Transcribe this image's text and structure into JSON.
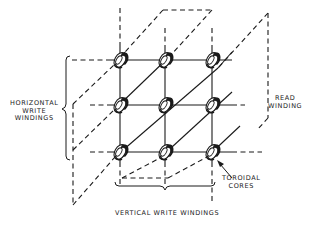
{
  "diagram": {
    "labels": {
      "horizontal_write_windings": [
        "HORIZONTAL",
        "WRITE",
        "WINDINGS"
      ],
      "read_winding": [
        "READ",
        "WINDING"
      ],
      "toroidal_cores": [
        "TOROIDAL",
        "CORES"
      ],
      "vertical_write_windings": "VERTICAL WRITE WINDINGS"
    },
    "grid": {
      "rows": 3,
      "columns": 3,
      "column_x": [
        120,
        165,
        212
      ],
      "row_y": [
        60,
        105,
        152
      ]
    },
    "colors": {
      "ink": "#1a1a1a",
      "background": "#ffffff"
    }
  }
}
